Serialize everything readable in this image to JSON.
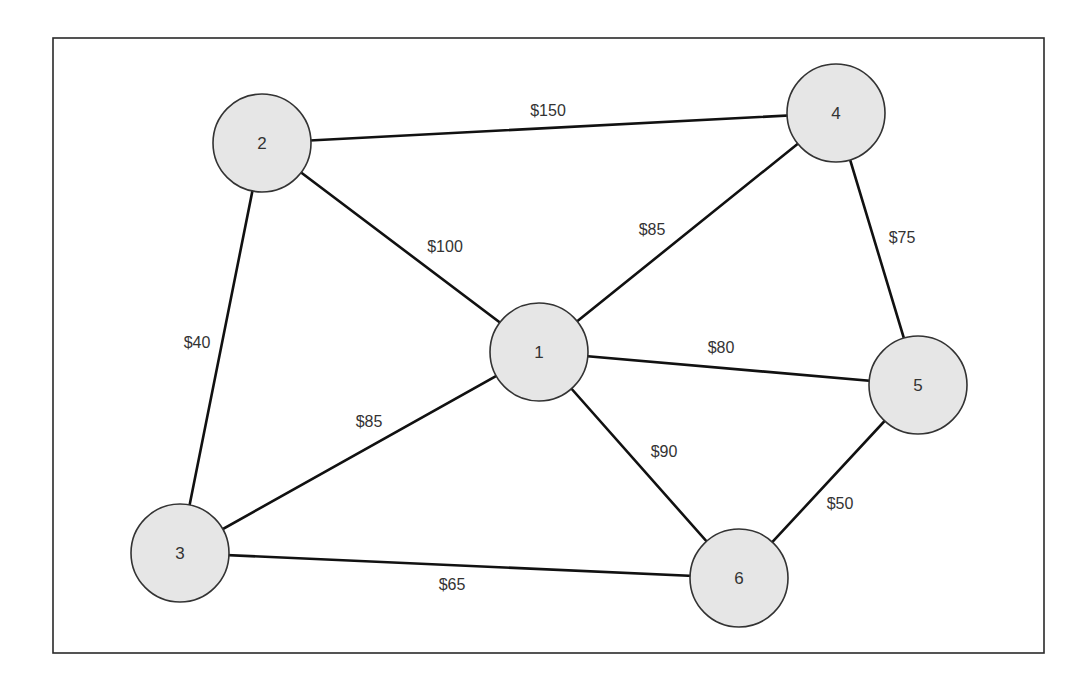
{
  "diagram": {
    "type": "weighted-undirected-graph",
    "frame": {
      "x": 53,
      "y": 38,
      "width": 991,
      "height": 615
    },
    "node_radius": 49,
    "nodes": [
      {
        "id": "1",
        "label": "1",
        "x": 539,
        "y": 352
      },
      {
        "id": "2",
        "label": "2",
        "x": 262,
        "y": 143
      },
      {
        "id": "3",
        "label": "3",
        "x": 180,
        "y": 553
      },
      {
        "id": "4",
        "label": "4",
        "x": 836,
        "y": 113
      },
      {
        "id": "5",
        "label": "5",
        "x": 918,
        "y": 385
      },
      {
        "id": "6",
        "label": "6",
        "x": 739,
        "y": 578
      }
    ],
    "edges": [
      {
        "from": "2",
        "to": "4",
        "label": "$150",
        "cost": 150,
        "lx": 548,
        "ly": 110
      },
      {
        "from": "2",
        "to": "1",
        "label": "$100",
        "cost": 100,
        "lx": 445,
        "ly": 246
      },
      {
        "from": "2",
        "to": "3",
        "label": "$40",
        "cost": 40,
        "lx": 197,
        "ly": 342
      },
      {
        "from": "1",
        "to": "4",
        "label": "$85",
        "cost": 85,
        "lx": 652,
        "ly": 229
      },
      {
        "from": "4",
        "to": "5",
        "label": "$75",
        "cost": 75,
        "lx": 902,
        "ly": 237
      },
      {
        "from": "1",
        "to": "5",
        "label": "$80",
        "cost": 80,
        "lx": 721,
        "ly": 347
      },
      {
        "from": "1",
        "to": "3",
        "label": "$85",
        "cost": 85,
        "lx": 369,
        "ly": 421
      },
      {
        "from": "1",
        "to": "6",
        "label": "$90",
        "cost": 90,
        "lx": 664,
        "ly": 451
      },
      {
        "from": "5",
        "to": "6",
        "label": "$50",
        "cost": 50,
        "lx": 840,
        "ly": 503
      },
      {
        "from": "3",
        "to": "6",
        "label": "$65",
        "cost": 65,
        "lx": 452,
        "ly": 584
      }
    ]
  }
}
